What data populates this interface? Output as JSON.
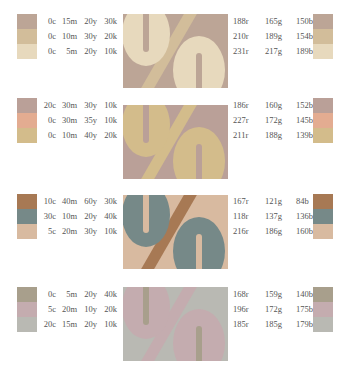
{
  "blocks": [
    {
      "rows": [
        {
          "cmyk": [
            "0c",
            "15m",
            "20y",
            "30k"
          ],
          "rgb": [
            "188r",
            "165g",
            "150b"
          ],
          "hex": "#bca596"
        },
        {
          "cmyk": [
            "0c",
            "10m",
            "30y",
            "20k"
          ],
          "rgb": [
            "210r",
            "189g",
            "154b"
          ],
          "hex": "#d2bd9a"
        },
        {
          "cmyk": [
            "0c",
            "5m",
            "20y",
            "10k"
          ],
          "rgb": [
            "231r",
            "217g",
            "189b"
          ],
          "hex": "#e7d9bd"
        }
      ],
      "image": {
        "background": "#bca596",
        "stripe": "#d2bd9a",
        "ovals": "#e7d9bd",
        "slot": "#bca596",
        "slash": "#d2bd9a"
      }
    },
    {
      "rows": [
        {
          "cmyk": [
            "20c",
            "30m",
            "30y",
            "10k"
          ],
          "rgb": [
            "186r",
            "160g",
            "152b"
          ],
          "hex": "#baa098"
        },
        {
          "cmyk": [
            "0c",
            "30m",
            "35y",
            "10k"
          ],
          "rgb": [
            "227r",
            "172g",
            "145b"
          ],
          "hex": "#e3ac91"
        },
        {
          "cmyk": [
            "0c",
            "10m",
            "40y",
            "20k"
          ],
          "rgb": [
            "211r",
            "188g",
            "139b"
          ],
          "hex": "#d3bc8b"
        }
      ],
      "image": {
        "background": "#baa098",
        "stripe": "#e3ac91",
        "ovals": "#d3bc8b",
        "slot": "#baa098",
        "slash": "#d3bc8b"
      }
    },
    {
      "rows": [
        {
          "cmyk": [
            "10c",
            "40m",
            "60y",
            "30k"
          ],
          "rgb": [
            "167r",
            "121g",
            "84b"
          ],
          "hex": "#a77954"
        },
        {
          "cmyk": [
            "30c",
            "10m",
            "20y",
            "40k"
          ],
          "rgb": [
            "118r",
            "137g",
            "136b"
          ],
          "hex": "#768988"
        },
        {
          "cmyk": [
            "5c",
            "20m",
            "30y",
            "10k"
          ],
          "rgb": [
            "216r",
            "186g",
            "160b"
          ],
          "hex": "#d8baa0"
        }
      ],
      "image": {
        "background": "#d8baa0",
        "stripe": "#d8baa0",
        "ovals": "#768988",
        "slot": "#d8baa0",
        "slash": "#a77954"
      }
    },
    {
      "rows": [
        {
          "cmyk": [
            "0c",
            "5m",
            "20y",
            "40k"
          ],
          "rgb": [
            "168r",
            "159g",
            "140b"
          ],
          "hex": "#a89f8c"
        },
        {
          "cmyk": [
            "5c",
            "20m",
            "10y",
            "20k"
          ],
          "rgb": [
            "196r",
            "172g",
            "175b"
          ],
          "hex": "#c4acaf"
        },
        {
          "cmyk": [
            "20c",
            "15m",
            "20y",
            "10k"
          ],
          "rgb": [
            "185r",
            "185g",
            "179b"
          ],
          "hex": "#b9b9b3"
        }
      ],
      "image": {
        "background": "#b9b9b3",
        "stripe": "#a89f8c",
        "ovals": "#c4acaf",
        "slot": "#a89f8c",
        "slash": "#c4acaf"
      }
    }
  ]
}
